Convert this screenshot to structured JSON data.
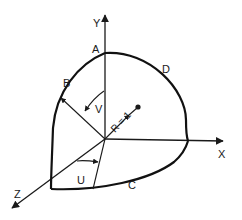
{
  "diagram": {
    "type": "spherical-octant-coordinate-diagram",
    "axes": {
      "x": "X",
      "y": "Y",
      "z": "Z"
    },
    "points": {
      "a": "A",
      "b": "B",
      "c": "C",
      "d": "D"
    },
    "angles": {
      "u": "U",
      "v": "V"
    },
    "radius_label": "R = 1",
    "colors": {
      "stroke": "#1a1a1a",
      "background": "#ffffff"
    }
  }
}
